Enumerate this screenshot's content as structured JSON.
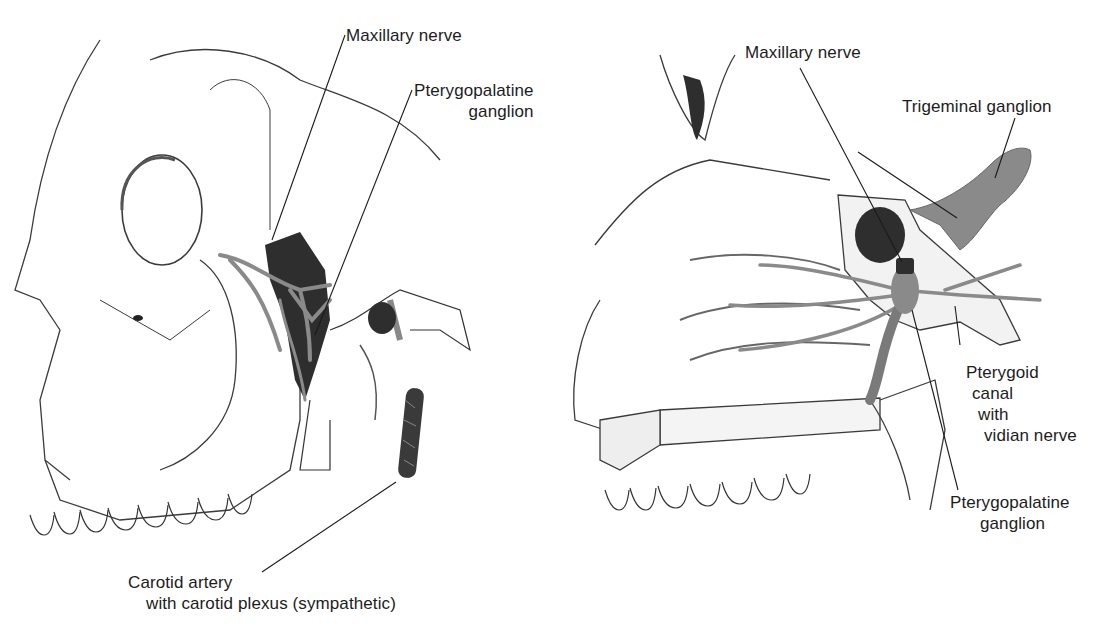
{
  "figure": {
    "left_panel": {
      "name": "lateral skull view",
      "labels": {
        "maxillary_nerve": "Maxillary nerve",
        "pterygopalatine_ganglion": [
          "Pterygopalatine",
          "ganglion"
        ],
        "carotid_artery": [
          "Carotid artery",
          "with carotid plexus (sympathetic)"
        ]
      }
    },
    "right_panel": {
      "name": "sagittal nasal cavity view",
      "labels": {
        "maxillary_nerve": "Maxillary nerve",
        "trigeminal_ganglion": "Trigeminal ganglion",
        "pterygoid_canal": [
          "Pterygoid",
          "canal",
          "with",
          "vidian nerve"
        ],
        "pterygopalatine_ganglion": [
          "Pterygopalatine",
          "ganglion"
        ]
      }
    },
    "colors": {
      "line": "#1a1a1a",
      "nerve_gray": "#8a8a8a",
      "dark_fill": "#2e2e2e",
      "bone_outline": "#3a3a3a"
    }
  }
}
